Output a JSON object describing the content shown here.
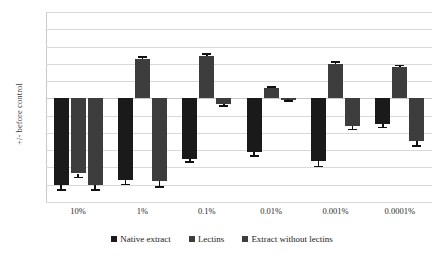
{
  "chart_data": {
    "type": "bar",
    "title": "",
    "xlabel": "",
    "ylabel": "+/- before control",
    "ylim": [
      -120,
      100
    ],
    "ytick_step": 20,
    "yticks": [
      100,
      80,
      60,
      40,
      20,
      0,
      -20,
      -40,
      -60,
      -80,
      -100,
      -120
    ],
    "grid": true,
    "legend_position": "bottom",
    "categories": [
      "10%",
      "1%",
      "0.1%",
      "0.01%",
      "0.001%",
      "0.0001%"
    ],
    "series": [
      {
        "name": "Native extract",
        "color": "#1a1a1a",
        "values": [
          -100,
          -95,
          -70,
          -62,
          -73,
          -30
        ],
        "errors": [
          5,
          4,
          3,
          4,
          5,
          3
        ]
      },
      {
        "name": "Lectins",
        "color": "#3d3d3d",
        "values": [
          -87,
          46,
          49,
          12,
          40,
          36
        ],
        "errors": [
          4,
          3,
          3,
          2,
          3,
          3
        ]
      },
      {
        "name": "Extract without lectins",
        "color": "#3d3d3d",
        "values": [
          -100,
          -96,
          -6,
          -1,
          -32,
          -49
        ],
        "errors": [
          5,
          6,
          2,
          1,
          3,
          5
        ]
      }
    ]
  },
  "legend": {
    "items": [
      {
        "label": "Native extract",
        "color": "#1a1a1a"
      },
      {
        "label": "Lectins",
        "color": "#3d3d3d"
      },
      {
        "label": "Extract without lectins",
        "color": "#3d3d3d"
      }
    ]
  }
}
